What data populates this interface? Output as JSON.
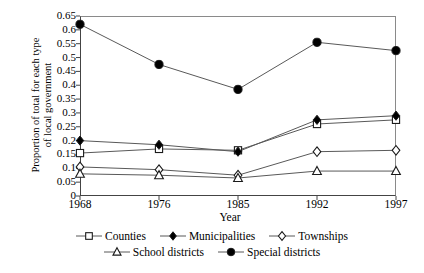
{
  "chart_data": {
    "type": "line",
    "title": "",
    "xlabel": "Year",
    "ylabel_line1": "Proportion of total for each type",
    "ylabel_line2": "of local government",
    "categories": [
      "1968",
      "1976",
      "1985",
      "1992",
      "1997"
    ],
    "ylim": [
      0,
      0.65
    ],
    "yticks": [
      "0",
      "0.05",
      "0.1",
      "0.15",
      "0.2",
      "0.25",
      "0.3",
      "0.35",
      "0.4",
      "0.45",
      "0.5",
      "0.55",
      "0.6",
      "0.65"
    ],
    "ytick_values": [
      0,
      0.05,
      0.1,
      0.15,
      0.2,
      0.25,
      0.3,
      0.35,
      0.4,
      0.45,
      0.5,
      0.55,
      0.6,
      0.65
    ],
    "grid": false,
    "legend_position": "bottom",
    "series": [
      {
        "name": "Counties",
        "marker": "open-square",
        "values": [
          0.155,
          0.17,
          0.165,
          0.26,
          0.275
        ]
      },
      {
        "name": "Municipalities",
        "marker": "filled-diamond",
        "values": [
          0.2,
          0.185,
          0.16,
          0.275,
          0.29
        ]
      },
      {
        "name": "Townships",
        "marker": "open-diamond",
        "values": [
          0.105,
          0.095,
          0.075,
          0.16,
          0.165
        ]
      },
      {
        "name": "School districts",
        "marker": "open-triangle",
        "values": [
          0.08,
          0.075,
          0.065,
          0.09,
          0.09
        ]
      },
      {
        "name": "Special districts",
        "marker": "filled-circle",
        "values": [
          0.62,
          0.475,
          0.385,
          0.555,
          0.525
        ]
      }
    ]
  },
  "legend": {
    "row1": [
      "Counties",
      "Municipalities",
      "Townships"
    ],
    "row2": [
      "School districts",
      "Special districts"
    ]
  },
  "colors": {
    "line": "#595959",
    "marker_stroke": "#1a1a1a",
    "marker_fill_open": "#ffffff",
    "marker_fill_solid": "#000000",
    "axis": "#444444",
    "frame_light": "#8a8a8a"
  }
}
